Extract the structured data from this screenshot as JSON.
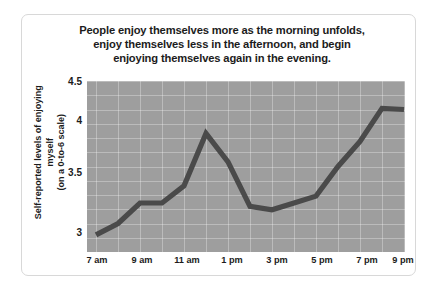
{
  "chart_data": {
    "type": "line",
    "title": "People enjoy themselves more as the morning unfolds, enjoy themselves less in the afternoon, and begin enjoying themselves again in the evening.",
    "title_lines": [
      "People enjoy themselves more as the morning unfolds,",
      "enjoy themselves less in the afternoon, and begin",
      "enjoying themselves again in the evening."
    ],
    "xlabel": "",
    "ylabel": "Self-reported levels of enjoying myself (on a 0-to-6 scale)",
    "ylabel_lines": [
      "Self-reported levels of enjoying myself",
      "(on a 0-to-6 scale)"
    ],
    "ylim": [
      3,
      4.5
    ],
    "yticks": [
      "3",
      "3.5",
      "4",
      "4.5"
    ],
    "ytick_values": [
      3,
      3.5,
      4,
      4.5
    ],
    "xticks": [
      "7 am",
      "9 am",
      "11 am",
      "1 pm",
      "3 pm",
      "5 pm",
      "7 pm",
      "9 pm"
    ],
    "x": [
      "7 am",
      "8 am",
      "9 am",
      "10 am",
      "11 am",
      "12 pm",
      "1 pm",
      "2 pm",
      "3 pm",
      "4 pm",
      "5 pm",
      "6 pm",
      "7 pm",
      "8 pm",
      "9 pm"
    ],
    "values": [
      3.15,
      3.25,
      3.43,
      3.43,
      3.58,
      4.04,
      3.79,
      3.4,
      3.37,
      3.43,
      3.49,
      3.75,
      3.97,
      4.26,
      4.25
    ],
    "grid": true,
    "legend": "none",
    "line_color": "#4a4a4a",
    "plot_background": "#9e9e9e",
    "grid_color": "#ffffff"
  },
  "figure": {
    "border_color": "#d8d8d8",
    "background": "#ffffff"
  }
}
